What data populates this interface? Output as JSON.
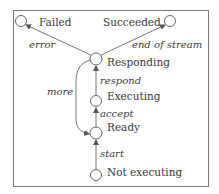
{
  "diagram": {
    "type": "state-machine",
    "states": [
      {
        "id": "failed",
        "label": "Failed"
      },
      {
        "id": "succeeded",
        "label": "Succeeded"
      },
      {
        "id": "responding",
        "label": "Responding"
      },
      {
        "id": "executing",
        "label": "Executing"
      },
      {
        "id": "ready",
        "label": "Ready"
      },
      {
        "id": "not_executing",
        "label": "Not executing"
      }
    ],
    "transitions": [
      {
        "from": "responding",
        "to": "failed",
        "label": "error"
      },
      {
        "from": "responding",
        "to": "succeeded",
        "label": "end of stream"
      },
      {
        "from": "executing",
        "to": "responding",
        "label": "respond"
      },
      {
        "from": "ready",
        "to": "executing",
        "label": "accept"
      },
      {
        "from": "not_executing",
        "to": "ready",
        "label": "start"
      },
      {
        "from": "responding",
        "to": "ready",
        "label": "more"
      }
    ]
  }
}
